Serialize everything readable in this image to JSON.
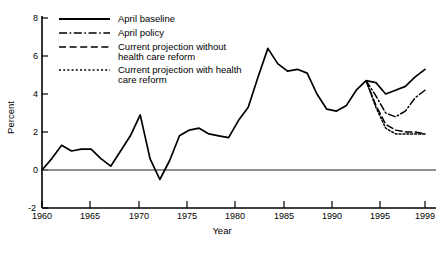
{
  "chart_data": {
    "type": "line",
    "title": "",
    "xlabel": "Year",
    "ylabel": "Percent",
    "xlim": [
      1960,
      1999
    ],
    "ylim": [
      -2,
      8
    ],
    "yticks": [
      -2,
      0,
      2,
      4,
      6,
      8
    ],
    "xticks": [
      1960,
      1965,
      1970,
      1975,
      1980,
      1985,
      1990,
      1995,
      1999
    ],
    "grid": false,
    "legend_position": "top-left-inside",
    "zero_line": true,
    "series": [
      {
        "name": "April baseline",
        "style": "solid",
        "x": [
          1960,
          1961,
          1962,
          1963,
          1964,
          1965,
          1966,
          1967,
          1968,
          1969,
          1970,
          1971,
          1972,
          1973,
          1974,
          1975,
          1976,
          1977,
          1978,
          1979,
          1980,
          1981,
          1982,
          1983,
          1984,
          1985,
          1986,
          1987,
          1988,
          1989,
          1990,
          1991,
          1992,
          1993,
          1994,
          1995,
          1996,
          1997,
          1998,
          1999
        ],
        "y": [
          0.0,
          0.6,
          1.3,
          1.0,
          1.1,
          1.1,
          0.6,
          0.2,
          1.0,
          1.8,
          2.9,
          0.6,
          -0.5,
          0.5,
          1.8,
          2.1,
          2.2,
          1.9,
          1.8,
          1.7,
          2.6,
          3.3,
          4.9,
          6.4,
          5.6,
          5.2,
          5.3,
          5.1,
          4.0,
          3.2,
          3.1,
          3.4,
          4.2,
          4.7,
          4.6,
          4.0,
          4.2,
          4.4,
          4.9,
          5.3
        ]
      },
      {
        "name": "April policy",
        "style": "dash-dot",
        "x": [
          1993,
          1994,
          1995,
          1996,
          1997,
          1998,
          1999
        ],
        "y": [
          4.7,
          3.9,
          3.0,
          2.8,
          3.1,
          3.8,
          4.2
        ]
      },
      {
        "name": "Current projection without health care reform",
        "style": "long-dash",
        "x": [
          1993,
          1994,
          1995,
          1996,
          1997,
          1998,
          1999
        ],
        "y": [
          4.7,
          3.4,
          2.4,
          2.1,
          2.0,
          2.0,
          1.9
        ]
      },
      {
        "name": "Current projection with health care reform",
        "style": "dotted",
        "x": [
          1993,
          1994,
          1995,
          1996,
          1997,
          1998,
          1999
        ],
        "y": [
          4.7,
          3.3,
          2.2,
          1.9,
          1.9,
          1.9,
          1.9
        ]
      }
    ]
  },
  "axes": {
    "y_title": "Percent",
    "x_title": "Year",
    "y_tick_labels": [
      "8",
      "6",
      "4",
      "2",
      "0",
      "-2"
    ],
    "x_tick_labels": [
      "1960",
      "1965",
      "1970",
      "1975",
      "1980",
      "1985",
      "1990",
      "1995",
      "1999"
    ]
  },
  "legend": {
    "items": [
      {
        "label": "April baseline",
        "style": "solid"
      },
      {
        "label": "April policy",
        "style": "dash-dot"
      },
      {
        "label_line1": "Current projection without",
        "label_line2": "health care reform",
        "style": "long-dash"
      },
      {
        "label_line1": "Current projection with health",
        "label_line2": "care reform",
        "style": "dotted"
      }
    ]
  },
  "footer": {
    "source": ""
  },
  "colors": {
    "line": "#000000",
    "axis": "#000000",
    "zero_line": "#5a5a5a",
    "background": "#ffffff"
  }
}
